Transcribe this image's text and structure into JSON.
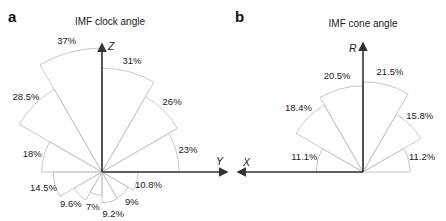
{
  "chart_data": [
    {
      "panel": "a",
      "type": "rose",
      "title": "IMF clock angle",
      "axes": {
        "horizontal": "Y",
        "vertical": "Z"
      },
      "sector_width_deg": 30,
      "sectors": [
        {
          "from_deg": 0,
          "to_deg": 30,
          "value": 23,
          "label": "23%"
        },
        {
          "from_deg": 30,
          "to_deg": 60,
          "value": 26,
          "label": "26%"
        },
        {
          "from_deg": 60,
          "to_deg": 90,
          "value": 31,
          "label": "31%"
        },
        {
          "from_deg": 90,
          "to_deg": 120,
          "value": 37,
          "label": "37%"
        },
        {
          "from_deg": 120,
          "to_deg": 150,
          "value": 28.5,
          "label": "28.5%"
        },
        {
          "from_deg": 150,
          "to_deg": 180,
          "value": 18,
          "label": "18%"
        },
        {
          "from_deg": 180,
          "to_deg": 210,
          "value": 14.5,
          "label": "14.5%"
        },
        {
          "from_deg": 210,
          "to_deg": 240,
          "value": 9.6,
          "label": "9.6%"
        },
        {
          "from_deg": 240,
          "to_deg": 270,
          "value": 7,
          "label": "7%"
        },
        {
          "from_deg": 270,
          "to_deg": 300,
          "value": 9.2,
          "label": "9.2%"
        },
        {
          "from_deg": 300,
          "to_deg": 330,
          "value": 9,
          "label": "9%"
        },
        {
          "from_deg": 330,
          "to_deg": 360,
          "value": 10.8,
          "label": "10.8%"
        }
      ]
    },
    {
      "panel": "b",
      "type": "rose",
      "title": "IMF cone angle",
      "axes": {
        "horizontal": "X",
        "vertical": "R"
      },
      "sector_width_deg": 30,
      "sectors": [
        {
          "from_deg": 0,
          "to_deg": 30,
          "value": 11.2,
          "label": "11.2%"
        },
        {
          "from_deg": 30,
          "to_deg": 60,
          "value": 15.8,
          "label": "15.8%"
        },
        {
          "from_deg": 60,
          "to_deg": 90,
          "value": 21.5,
          "label": "21.5%"
        },
        {
          "from_deg": 90,
          "to_deg": 120,
          "value": 20.5,
          "label": "20.5%"
        },
        {
          "from_deg": 120,
          "to_deg": 150,
          "value": 18.4,
          "label": "18.4%"
        },
        {
          "from_deg": 150,
          "to_deg": 180,
          "value": 11.1,
          "label": "11.1%"
        }
      ]
    }
  ],
  "panels": {
    "a": {
      "label": "a",
      "title": "IMF clock angle",
      "x_axis": "Y",
      "y_axis": "Z"
    },
    "b": {
      "label": "b",
      "title": "IMF cone angle",
      "x_axis": "X",
      "y_axis": "R"
    }
  },
  "colors": {
    "sector_stroke": "#c8c8c8",
    "axis": "#333333",
    "text": "#222222"
  }
}
